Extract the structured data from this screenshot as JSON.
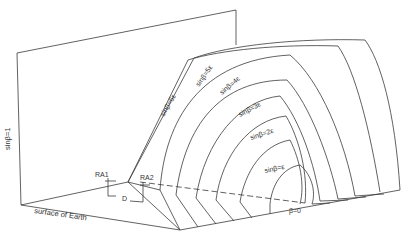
{
  "diagram": {
    "y_axis_label": "sinβ=1",
    "ground_label": "surface of Earth",
    "receiver_1": "RA1",
    "receiver_2": "RA2",
    "baseline_label": "D",
    "zero_label": "β=0",
    "arc_labels": [
      "sinβ=ε",
      "sinβ=2ε",
      "sinβ=3ε",
      "sinβ=4ε",
      "sinβ=5ε",
      "sinβ=6ε"
    ]
  }
}
